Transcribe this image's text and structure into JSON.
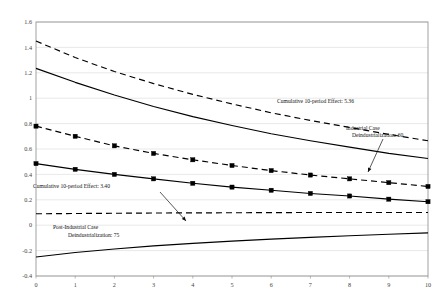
{
  "chart_data": {
    "type": "line",
    "title": "",
    "xlabel": "",
    "ylabel": "",
    "x": [
      0,
      1,
      2,
      3,
      4,
      5,
      6,
      7,
      8,
      9,
      10
    ],
    "xlim": [
      0,
      10
    ],
    "ylim": [
      -0.4,
      1.6
    ],
    "ytick_labels": [
      "1.6",
      "1.4",
      "1.2",
      "1",
      "0.8",
      "0.6",
      "0.4",
      "0.2",
      "0",
      "-0.2",
      "-0.4"
    ],
    "ytick_values": [
      1.6,
      1.4,
      1.2,
      1.0,
      0.8,
      0.6,
      0.4,
      0.2,
      0.0,
      -0.2,
      -0.4
    ],
    "xtick_labels": [
      "0",
      "1",
      "2",
      "3",
      "4",
      "5",
      "6",
      "7",
      "8",
      "9",
      "10"
    ],
    "grid": true,
    "grid_axis": "y",
    "legend": "none",
    "series": [
      {
        "name": "Industrial Case upper band",
        "style": "dashed",
        "marker": "none",
        "color": "#000000",
        "values": [
          1.45,
          1.32,
          1.21,
          1.115,
          1.03,
          0.955,
          0.885,
          0.825,
          0.77,
          0.715,
          0.665
        ]
      },
      {
        "name": "Industrial Case mean",
        "style": "solid",
        "marker": "none",
        "color": "#000000",
        "values": [
          1.235,
          1.125,
          1.025,
          0.935,
          0.855,
          0.785,
          0.72,
          0.665,
          0.615,
          0.565,
          0.525
        ]
      },
      {
        "name": "Industrial Case lower band",
        "style": "dashed",
        "marker": "square",
        "color": "#000000",
        "values": [
          0.78,
          0.7,
          0.625,
          0.565,
          0.515,
          0.47,
          0.43,
          0.395,
          0.365,
          0.335,
          0.305
        ]
      },
      {
        "name": "Post-Industrial Case mean",
        "style": "solid",
        "marker": "square",
        "color": "#000000",
        "values": [
          0.485,
          0.44,
          0.4,
          0.365,
          0.33,
          0.3,
          0.275,
          0.25,
          0.23,
          0.205,
          0.185
        ]
      },
      {
        "name": "Post-Industrial Case upper band",
        "style": "dashed",
        "marker": "none",
        "color": "#000000",
        "values": [
          0.09,
          0.092,
          0.094,
          0.096,
          0.097,
          0.098,
          0.099,
          0.1,
          0.1,
          0.1,
          0.1
        ]
      },
      {
        "name": "Post-Industrial Case lower band",
        "style": "solid",
        "marker": "none",
        "color": "#000000",
        "values": [
          -0.25,
          -0.215,
          -0.187,
          -0.163,
          -0.143,
          -0.125,
          -0.11,
          -0.096,
          -0.083,
          -0.071,
          -0.06
        ]
      }
    ],
    "annotations": [
      {
        "id": "industrial-cumulative-effect",
        "text": "Cumulative 10-period Effect: 5.36",
        "x_px": 277,
        "y_px": 103
      },
      {
        "id": "industrial-case-label-line1",
        "text": "Industrial Case",
        "x_px": 346,
        "y_px": 130
      },
      {
        "id": "industrial-case-label-line2",
        "text": "Deindustrialization: 60",
        "x_px": 352,
        "y_px": 137
      },
      {
        "id": "postindustrial-cumulative-effect",
        "text": "Cumulative 10-period Effect: 3.40",
        "x_px": 33,
        "y_px": 188
      },
      {
        "id": "postindustrial-case-label-line1",
        "text": "Post-Industrial Case",
        "x_px": 53,
        "y_px": 229
      },
      {
        "id": "postindustrial-case-label-line2",
        "text": "Deindustrialization: 75",
        "x_px": 68,
        "y_px": 237
      }
    ],
    "leader_lines": [
      {
        "id": "industrial-leader",
        "x1": 383,
        "y1": 139,
        "x2": 368,
        "y2": 172
      },
      {
        "id": "postindustrial-leader",
        "x1": 160,
        "y1": 192,
        "x2": 186,
        "y2": 221
      }
    ]
  }
}
